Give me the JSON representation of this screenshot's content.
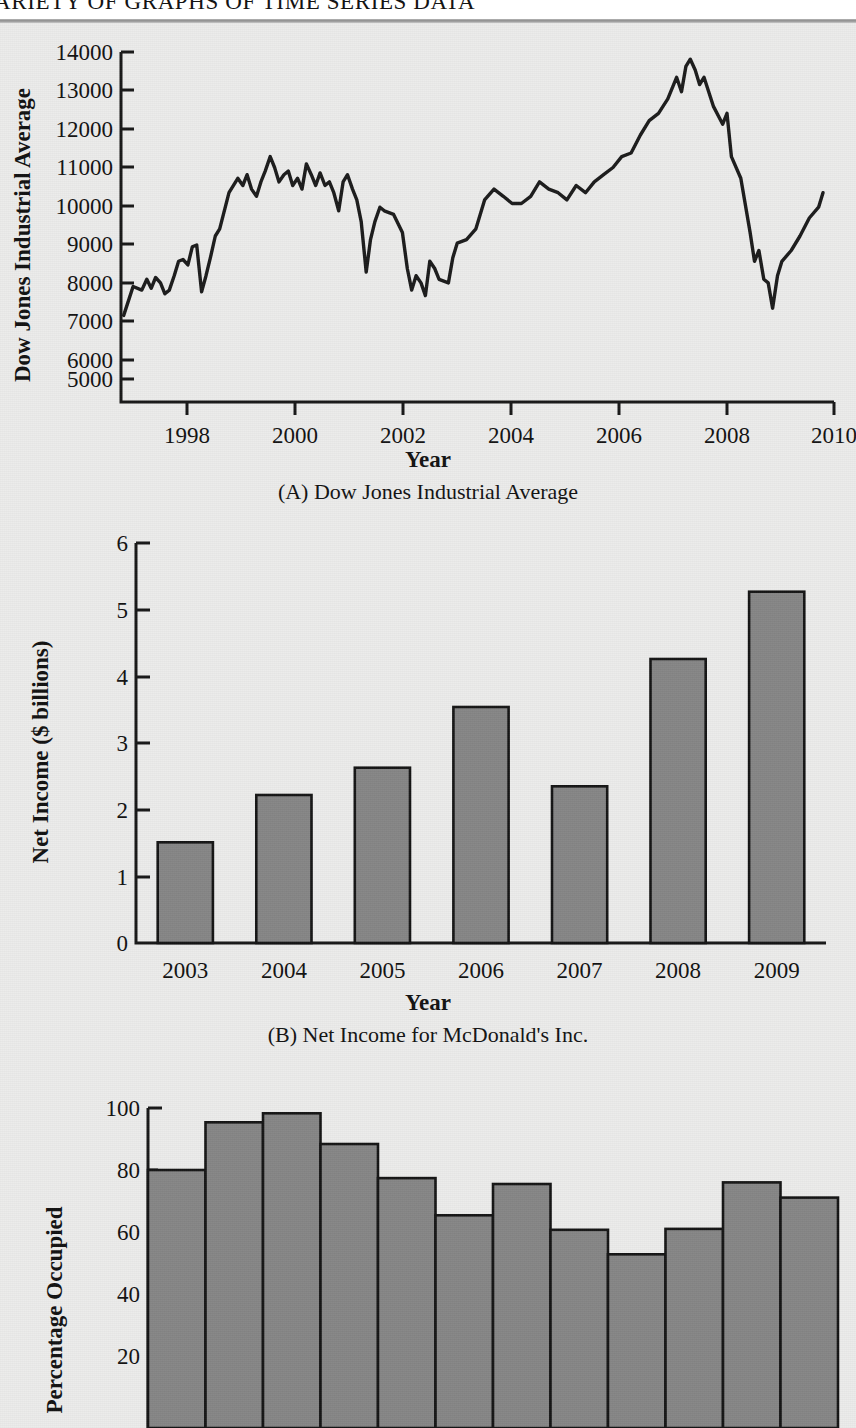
{
  "header": {
    "running_head": "A VARIETY OF GRAPHS OF TIME SERIES DATA",
    "running_head_visible": "IETY OF GRAPHS OF TIME SERIES DATA"
  },
  "colors": {
    "paper": "#ececeb",
    "ink": "#141414",
    "bar_fill": "#868686",
    "bar_stroke": "#141414",
    "rule": "#8d8d8d"
  },
  "figures": [
    {
      "id": "figure-a",
      "caption": "(A) Dow Jones Industrial Average",
      "xlabel": "Year",
      "ylabel": "Dow Jones Industrial Average"
    },
    {
      "id": "figure-b",
      "caption": "(B) Net Income for McDonald's Inc.",
      "xlabel": "Year",
      "ylabel": "Net Income ($ billions)"
    },
    {
      "id": "figure-c",
      "caption": "",
      "xlabel": "",
      "ylabel": "Percentage Occupied"
    }
  ],
  "chart_data": [
    {
      "type": "line",
      "id": "dow-jones-industrial-average",
      "title": "(A) Dow Jones Industrial Average",
      "xlabel": "Year",
      "ylabel": "Dow Jones Industrial Average",
      "grid": false,
      "legend": "none",
      "xlim": [
        1997.2,
        2010.2
      ],
      "ylim": [
        4600,
        14300
      ],
      "xticks": [
        1998,
        2000,
        2002,
        2004,
        2006,
        2008,
        2010
      ],
      "xticklabels": [
        "1998",
        "2000",
        "2002",
        "2004",
        "2006",
        "2008",
        "2010"
      ],
      "yticks": [
        5000,
        6000,
        7000,
        8000,
        9000,
        10000,
        11000,
        12000,
        13000,
        14000
      ],
      "yticklabels": [
        "5000",
        "6000",
        "7000",
        "8000",
        "9000",
        "10000",
        "11000",
        "12000",
        "13000",
        "14000"
      ],
      "x": [
        1997.25,
        1997.42,
        1997.58,
        1997.67,
        1997.75,
        1997.83,
        1997.92,
        1998.0,
        1998.08,
        1998.17,
        1998.25,
        1998.33,
        1998.42,
        1998.5,
        1998.58,
        1998.67,
        1998.75,
        1998.83,
        1998.92,
        1999.0,
        1999.17,
        1999.33,
        1999.42,
        1999.5,
        1999.58,
        1999.67,
        1999.75,
        1999.83,
        1999.92,
        2000.0,
        2000.08,
        2000.17,
        2000.25,
        2000.33,
        2000.42,
        2000.5,
        2000.58,
        2000.67,
        2000.75,
        2000.83,
        2000.92,
        2001.0,
        2001.08,
        2001.17,
        2001.25,
        2001.33,
        2001.42,
        2001.5,
        2001.58,
        2001.67,
        2001.75,
        2001.83,
        2001.92,
        2002.0,
        2002.17,
        2002.33,
        2002.42,
        2002.5,
        2002.58,
        2002.67,
        2002.75,
        2002.83,
        2002.92,
        2003.0,
        2003.17,
        2003.25,
        2003.33,
        2003.5,
        2003.67,
        2003.83,
        2004.0,
        2004.17,
        2004.33,
        2004.5,
        2004.67,
        2004.83,
        2005.0,
        2005.17,
        2005.33,
        2005.5,
        2005.67,
        2005.83,
        2006.0,
        2006.17,
        2006.33,
        2006.5,
        2006.67,
        2006.83,
        2007.0,
        2007.17,
        2007.33,
        2007.42,
        2007.5,
        2007.58,
        2007.67,
        2007.75,
        2007.83,
        2008.0,
        2008.17,
        2008.25,
        2008.33,
        2008.5,
        2008.67,
        2008.75,
        2008.83,
        2008.92,
        2009.0,
        2009.08,
        2009.17,
        2009.25,
        2009.42,
        2009.58,
        2009.75,
        2009.92,
        2010.0
      ],
      "y": [
        7000,
        7800,
        7700,
        8000,
        7750,
        8050,
        7900,
        7600,
        7700,
        8100,
        8500,
        8550,
        8400,
        8900,
        8950,
        7650,
        8100,
        8600,
        9200,
        9400,
        10400,
        10800,
        10600,
        10900,
        10500,
        10300,
        10700,
        11000,
        11400,
        11100,
        10700,
        10900,
        11000,
        10600,
        10800,
        10500,
        11200,
        10900,
        10600,
        10950,
        10600,
        10700,
        10400,
        9900,
        10700,
        10900,
        10500,
        10200,
        9600,
        8200,
        9100,
        9600,
        10000,
        9900,
        9800,
        9300,
        8300,
        7700,
        8100,
        7900,
        7550,
        8500,
        8300,
        8000,
        7900,
        8600,
        9000,
        9100,
        9400,
        10200,
        10500,
        10300,
        10100,
        10100,
        10300,
        10700,
        10500,
        10400,
        10200,
        10600,
        10400,
        10700,
        10900,
        11100,
        11400,
        11500,
        12000,
        12400,
        12600,
        13000,
        13600,
        13200,
        13900,
        14100,
        13800,
        13400,
        13600,
        12800,
        12300,
        12600,
        11400,
        10800,
        9300,
        8500,
        8800,
        8000,
        7900,
        7200,
        8100,
        8500,
        8800,
        9200,
        9700,
        10000,
        10400,
        10600
      ],
      "series_note": "Monthly closing values, Jan 1997 - Jan 2010. Peak ~14100 in 2007; trough ~7200 in early 2009."
    },
    {
      "type": "bar",
      "id": "mcdonalds-net-income",
      "title": "(B) Net Income for McDonald's Inc.",
      "xlabel": "Year",
      "ylabel": "Net Income ($ billions)",
      "grid": false,
      "legend": "none",
      "categories": [
        "2003",
        "2004",
        "2005",
        "2006",
        "2007",
        "2008",
        "2009"
      ],
      "values": [
        1.51,
        2.22,
        2.63,
        3.54,
        2.35,
        4.26,
        5.27
      ],
      "ylim": [
        0,
        6
      ],
      "yticks": [
        0,
        1,
        2,
        3,
        4,
        5,
        6
      ],
      "yticklabels": [
        "0",
        "1",
        "2",
        "3",
        "4",
        "5",
        "6"
      ]
    },
    {
      "type": "bar",
      "id": "percentage-occupied",
      "title": "",
      "xlabel": "",
      "ylabel": "Percentage Occupied",
      "grid": false,
      "legend": "none",
      "categories": [
        "1",
        "2",
        "3",
        "4",
        "5",
        "6",
        "7",
        "8",
        "9",
        "10",
        "11",
        "12"
      ],
      "values": [
        80.0,
        95.4,
        98.3,
        88.4,
        77.4,
        65.4,
        75.5,
        60.7,
        52.8,
        61.0,
        76.0,
        71.1
      ],
      "ylim": [
        0,
        100
      ],
      "yticks": [
        20,
        40,
        60,
        80,
        100
      ],
      "yticklabels": [
        "20",
        "40",
        "60",
        "80",
        "100"
      ],
      "minor_yticks": [
        10,
        30,
        50,
        70,
        90
      ],
      "note": "Bars are contiguous (histogram style); chart is clipped by the bottom page edge below the 20 tick."
    }
  ]
}
